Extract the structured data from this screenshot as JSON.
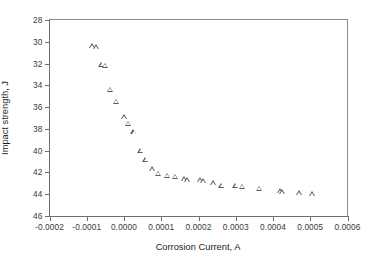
{
  "chart_data": {
    "type": "scatter",
    "title": "",
    "xlabel": "Corrosion Current, A",
    "ylabel": "Impact strength, J",
    "xlim": [
      -0.0002,
      0.0006
    ],
    "ylim": [
      28,
      46
    ],
    "y_axis_inverted": true,
    "grid": false,
    "legend": null,
    "marker": "open-triangle-up",
    "marker_color": "#5d5d5d",
    "xticks": [
      -0.0002,
      -0.0001,
      0.0,
      0.0001,
      0.0002,
      0.0003,
      0.0004,
      0.0005,
      0.0006
    ],
    "xtick_labels": [
      "-0.0002",
      "-0.0001",
      "0.0000",
      "0.0001",
      "0.0002",
      "0.0003",
      "0.0004",
      "0.0005",
      "0.0006"
    ],
    "yticks": [
      28,
      30,
      32,
      34,
      36,
      38,
      40,
      42,
      44,
      46
    ],
    "ytick_labels": [
      "28",
      "30",
      "32",
      "34",
      "36",
      "38",
      "40",
      "42",
      "44",
      "46"
    ],
    "series": [
      {
        "name": "Impact strength vs corrosion current",
        "points": [
          {
            "x": -8.5e-05,
            "y": 29.9
          },
          {
            "x": -7.5e-05,
            "y": 30.0
          },
          {
            "x": -6e-05,
            "y": 31.6
          },
          {
            "x": -5e-05,
            "y": 31.7
          },
          {
            "x": -3.8e-05,
            "y": 33.9
          },
          {
            "x": -2.2e-05,
            "y": 35.0
          },
          {
            "x": 0.0,
            "y": 36.4
          },
          {
            "x": 1.2e-05,
            "y": 37.0
          },
          {
            "x": 2.6e-05,
            "y": 37.8
          },
          {
            "x": 4.5e-05,
            "y": 39.5
          },
          {
            "x": 5.8e-05,
            "y": 40.3
          },
          {
            "x": 7.5e-05,
            "y": 41.2
          },
          {
            "x": 9.2e-05,
            "y": 41.6
          },
          {
            "x": 0.000115,
            "y": 41.8
          },
          {
            "x": 0.000138,
            "y": 41.9
          },
          {
            "x": 0.000162,
            "y": 42.1
          },
          {
            "x": 0.00017,
            "y": 42.2
          },
          {
            "x": 0.000205,
            "y": 42.2
          },
          {
            "x": 0.000212,
            "y": 42.3
          },
          {
            "x": 0.00024,
            "y": 42.5
          },
          {
            "x": 0.000262,
            "y": 42.7
          },
          {
            "x": 0.0003,
            "y": 42.7
          },
          {
            "x": 0.000318,
            "y": 42.8
          },
          {
            "x": 0.000362,
            "y": 43.0
          },
          {
            "x": 0.00042,
            "y": 43.2
          },
          {
            "x": 0.000425,
            "y": 43.3
          },
          {
            "x": 0.00047,
            "y": 43.4
          },
          {
            "x": 0.000505,
            "y": 43.5
          }
        ]
      }
    ]
  }
}
